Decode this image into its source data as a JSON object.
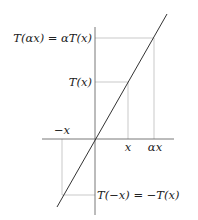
{
  "diagram": {
    "labels": {
      "t_alpha_x": "T(αx) = αT(x)",
      "t_x": "T(x)",
      "t_neg_x": "T(−x) = −T(x)",
      "neg_x": "−x",
      "x": "x",
      "alpha_x": "αx"
    },
    "colors": {
      "axis": "#555555",
      "guide": "#bbbbbb",
      "line": "#333333"
    }
  }
}
